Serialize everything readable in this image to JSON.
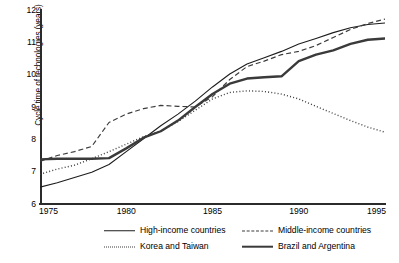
{
  "chart_data": {
    "type": "line",
    "title": "",
    "xlabel": "",
    "ylabel": "Cycle time of technologies (years)",
    "xlim": [
      1975,
      1995
    ],
    "ylim": [
      6,
      12
    ],
    "grid": false,
    "legend_position": "below-plot",
    "x_ticks": [
      "1975",
      "1980",
      "1985",
      "1990",
      "1995"
    ],
    "x_tick_values": [
      1975,
      1980,
      1985,
      1990,
      1995
    ],
    "y_ticks": [
      "6",
      "7",
      "8",
      "9",
      "10",
      "11",
      "12"
    ],
    "y_tick_values": [
      6,
      7,
      8,
      9,
      10,
      11,
      12
    ],
    "x": [
      1975,
      1976,
      1977,
      1978,
      1979,
      1980,
      1981,
      1982,
      1983,
      1984,
      1985,
      1986,
      1987,
      1988,
      1989,
      1990,
      1991,
      1992,
      1993,
      1994,
      1995
    ],
    "series": [
      {
        "name": "High-income countries",
        "style": "solid-thin",
        "color": "#1c1c1c",
        "values": [
          6.52,
          6.66,
          6.82,
          6.98,
          7.22,
          7.62,
          8.02,
          8.42,
          8.78,
          9.18,
          9.62,
          10.02,
          10.33,
          10.52,
          10.72,
          10.95,
          11.12,
          11.3,
          11.45,
          11.55,
          11.6
        ]
      },
      {
        "name": "Middle-income countries",
        "style": "dashed",
        "color": "#3d3d3d",
        "values": [
          7.32,
          7.5,
          7.62,
          7.78,
          8.52,
          8.78,
          8.95,
          9.05,
          9.02,
          9.0,
          9.32,
          9.85,
          10.25,
          10.42,
          10.62,
          10.72,
          10.9,
          11.15,
          11.4,
          11.58,
          11.72
        ]
      },
      {
        "name": "Korea and Taiwan",
        "style": "dotted",
        "color": "#3d3d3d",
        "values": [
          6.92,
          7.08,
          7.2,
          7.4,
          7.62,
          7.85,
          8.08,
          8.25,
          8.55,
          8.9,
          9.25,
          9.45,
          9.5,
          9.48,
          9.4,
          9.25,
          9.02,
          8.8,
          8.58,
          8.38,
          8.22
        ]
      },
      {
        "name": "Brazil and Argentina",
        "style": "solid-thick",
        "color": "#3a3a3a",
        "values": [
          7.38,
          7.4,
          7.4,
          7.4,
          7.42,
          7.72,
          8.05,
          8.25,
          8.58,
          9.0,
          9.4,
          9.72,
          9.88,
          9.92,
          9.95,
          10.42,
          10.62,
          10.75,
          10.95,
          11.08,
          11.12
        ]
      }
    ]
  },
  "axes": {
    "y_axis_title": "Cycle time of technologies (years)"
  },
  "legend": {
    "items": [
      {
        "label": "High-income countries",
        "style": "solid-thin"
      },
      {
        "label": "Middle-income countries",
        "style": "dashed"
      },
      {
        "label": "Korea and Taiwan",
        "style": "dotted"
      },
      {
        "label": "Brazil and Argentina",
        "style": "solid-thick"
      }
    ]
  }
}
